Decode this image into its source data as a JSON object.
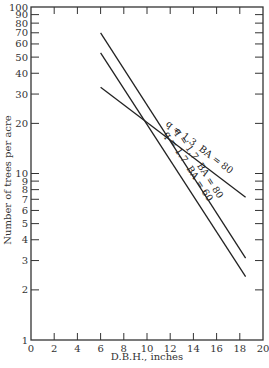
{
  "chart_data": {
    "type": "line",
    "title": "",
    "xlabel": "D.B.H., inches",
    "ylabel": "Number of trees per acre",
    "xlim": [
      0,
      20
    ],
    "ylim": [
      1,
      100
    ],
    "yscale": "log",
    "grid": false,
    "x_ticks": [
      0,
      2,
      4,
      6,
      8,
      10,
      12,
      14,
      16,
      18,
      20
    ],
    "y_ticks": [
      1,
      2,
      3,
      4,
      5,
      6,
      7,
      8,
      9,
      10,
      20,
      30,
      40,
      50,
      60,
      70,
      80,
      90,
      100
    ],
    "y_tick_labels": [
      "1",
      "2",
      "3",
      "4",
      "5",
      "6",
      "7",
      "8",
      "9",
      "10",
      "20",
      "30",
      "40",
      "50",
      "60",
      "70",
      "80",
      "90",
      "100"
    ],
    "series": [
      {
        "name": "q = 1.7  BA = 80",
        "x": [
          6,
          18.5
        ],
        "values": [
          70,
          3.1
        ]
      },
      {
        "name": "q = 1.7  BA = 60",
        "x": [
          6,
          18.5
        ],
        "values": [
          53,
          2.4
        ]
      },
      {
        "name": "q = 1.3  BA = 80",
        "x": [
          6,
          18.5
        ],
        "values": [
          33,
          7.2
        ]
      }
    ],
    "annotations": [
      "q = 1.3  BA = 80",
      "q = 1.7  BA = 80",
      "q = 1.7  BA = 60"
    ]
  }
}
